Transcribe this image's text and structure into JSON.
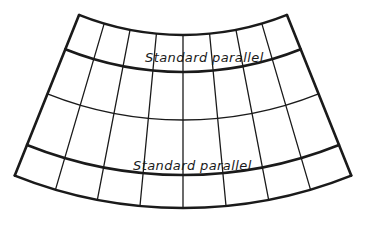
{
  "diagram": {
    "type": "conic-projection-graticule",
    "colors": {
      "line": "#1a1a1a",
      "background": "#ffffff"
    },
    "geometry": {
      "center_x": 183,
      "center_y": -245,
      "half_angle_deg": 21.8,
      "meridian_count": 9,
      "parallels": [
        {
          "radius": 280,
          "kind": "border",
          "stroke": 2.4
        },
        {
          "radius": 317,
          "kind": "standard",
          "stroke": 2.6
        },
        {
          "radius": 365,
          "kind": "regular",
          "stroke": 1.3
        },
        {
          "radius": 420,
          "kind": "standard",
          "stroke": 2.6
        },
        {
          "radius": 453,
          "kind": "border",
          "stroke": 2.6
        }
      ]
    },
    "labels": {
      "standard_parallel_upper": "Standard parallel",
      "standard_parallel_lower": "Standard parallel"
    }
  }
}
